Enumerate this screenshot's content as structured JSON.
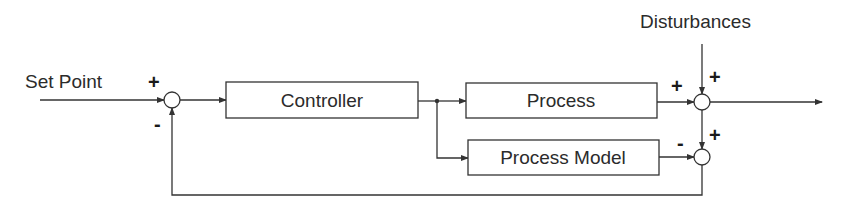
{
  "diagram": {
    "type": "block-diagram",
    "labels": {
      "set_point": "Set Point",
      "disturbances": "Disturbances"
    },
    "blocks": {
      "controller": "Controller",
      "process": "Process",
      "process_model": "Process Model"
    },
    "signs": {
      "sum1_setpoint": "+",
      "sum1_feedback": "-",
      "sum2_process": "+",
      "sum2_disturbance": "+",
      "sum3_model": "-",
      "sum3_output": "+"
    },
    "colors": {
      "line": "#333333",
      "text": "#2b2b2b",
      "background": "#ffffff"
    }
  }
}
